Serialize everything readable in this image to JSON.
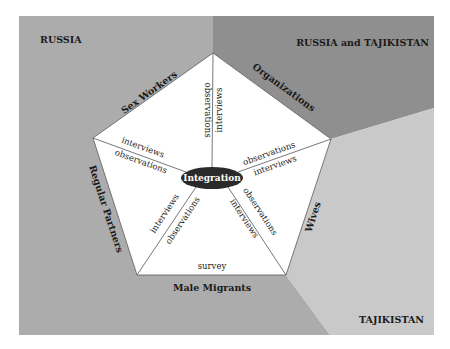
{
  "regions": {
    "russia": {
      "label": "RUSSIA",
      "color": "#acacac"
    },
    "russia_tajikistan": {
      "label": "RUSSIA and TAJIKISTAN",
      "color": "#8f8f8f"
    },
    "tajikistan": {
      "label": "TAJIKISTAN",
      "color": "#c9c9c9"
    }
  },
  "pentagon_sides": {
    "sex_workers": "Sex Workers",
    "organizations": "Organizations",
    "wives": "Wives",
    "male_migrants": "Male Migrants",
    "regular_partners": "Regular Partners"
  },
  "center": {
    "label": "Integration",
    "color": "#2a2a2a"
  },
  "methods": {
    "top_left": "observations",
    "top_right": "interviews",
    "right_upper": "observations",
    "right_lower": "interviews",
    "lower_right_upper": "observations",
    "lower_right_lower": "interviews",
    "lower_left_upper": "interviews",
    "lower_left_lower": "observations",
    "left_upper": "interviews",
    "left_lower": "observations",
    "bottom": "survey"
  }
}
